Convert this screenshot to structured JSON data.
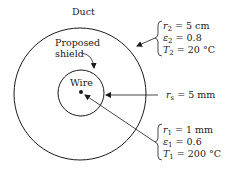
{
  "diagram": {
    "labels": {
      "duct": "Duct",
      "shield_line1": "Proposed",
      "shield_line2": "shield",
      "wire": "Wire"
    },
    "duct_params": [
      {
        "sym": "r",
        "sub": "2",
        "val": " = 5 cm"
      },
      {
        "sym": "ε",
        "sub": "2",
        "val": " = 0.8"
      },
      {
        "sym": "T",
        "sub": "2",
        "val": " = 20 °C"
      }
    ],
    "shield_param": {
      "sym": "r",
      "sub": "s",
      "val": " = 5 mm"
    },
    "wire_params": [
      {
        "sym": "r",
        "sub": "1",
        "val": " = 1 mm"
      },
      {
        "sym": "ε",
        "sub": "1",
        "val": " = 0.6"
      },
      {
        "sym": "T",
        "sub": "1",
        "val": " = 200 °C"
      }
    ],
    "colors": {
      "line": "#1a1a1a",
      "background": "#ffffff"
    }
  }
}
